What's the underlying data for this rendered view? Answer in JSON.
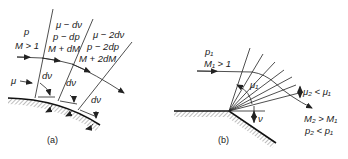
{
  "figure_a": {
    "caption": "(a)",
    "region1": {
      "pressure": "p",
      "mach": "M > 1"
    },
    "region2": {
      "angle": "μ − dν",
      "pressure": "p − dp",
      "mach": "M + dM"
    },
    "region3": {
      "angle": "μ − 2dν",
      "pressure": "p − 2dp",
      "mach": "M + 2dM"
    },
    "mach_angle_label": "μ",
    "turn_labels": [
      "dν",
      "dν",
      "dν"
    ]
  },
  "figure_b": {
    "caption": "(b)",
    "upstream": {
      "pressure": "p₁",
      "mach": "M₁ > 1"
    },
    "mach_angle_1": "μ₁",
    "mach_angle_2": "μ₂ < μ₁",
    "turn_angle": "ν",
    "downstream": {
      "mach": "M₂ > M₁",
      "pressure": "p₂ < p₁"
    }
  }
}
